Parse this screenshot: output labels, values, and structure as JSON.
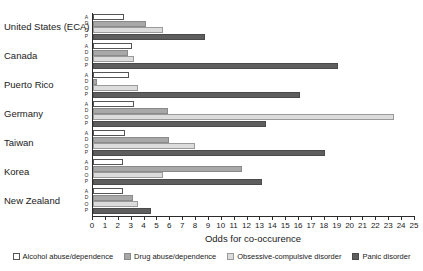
{
  "chart_data": {
    "type": "bar",
    "orientation": "horizontal",
    "title": "",
    "xlabel": "Odds for co-occurence",
    "ylabel": "",
    "xlim": [
      0,
      25
    ],
    "xticks": [
      0,
      1,
      2,
      3,
      4,
      5,
      6,
      7,
      8,
      9,
      10,
      11,
      12,
      13,
      14,
      15,
      16,
      17,
      18,
      19,
      20,
      21,
      22,
      23,
      24,
      25
    ],
    "grid": false,
    "legend_position": "bottom",
    "categories": [
      "United States (ECA)",
      "Canada",
      "Puerto Rico",
      "Germany",
      "Taiwan",
      "Korea",
      "New Zealand"
    ],
    "subcategory_codes": [
      "A",
      "D",
      "O",
      "P"
    ],
    "series": [
      {
        "name": "Alcohol abuse/dependence",
        "code": "A",
        "color": "#ffffff",
        "values": [
          2.4,
          3.0,
          2.8,
          3.2,
          2.5,
          2.3,
          2.3
        ]
      },
      {
        "name": "Drug abuse/dependence",
        "code": "D",
        "color": "#a8a8a8",
        "values": [
          4.1,
          2.7,
          0.3,
          5.8,
          5.9,
          11.6,
          3.1
        ]
      },
      {
        "name": "Obsessive-compulsive disorder",
        "code": "O",
        "color": "#dcdcdc",
        "values": [
          5.4,
          3.2,
          3.5,
          23.4,
          7.9,
          5.4,
          3.5
        ]
      },
      {
        "name": "Panic disorder",
        "code": "P",
        "color": "#5e5e5e",
        "values": [
          8.7,
          19.0,
          16.1,
          13.4,
          18.0,
          13.1,
          4.5
        ]
      }
    ]
  }
}
